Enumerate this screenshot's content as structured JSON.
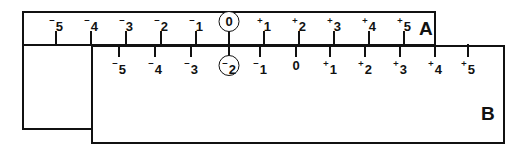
{
  "figure": {
    "ink_color": "#111111",
    "background_color": "#ffffff"
  },
  "slides": [
    {
      "id": "a",
      "letter": "A",
      "scale_name": "upper-scale",
      "origin_value": "0",
      "highlighted_reading": "0",
      "ticks": [
        {
          "value": -5,
          "sign": "⁻",
          "digit": "5",
          "x": 56,
          "circled": false
        },
        {
          "value": -4,
          "sign": "⁻",
          "digit": "4",
          "x": 91,
          "circled": false
        },
        {
          "value": -3,
          "sign": "⁻",
          "digit": "3",
          "x": 126,
          "circled": false
        },
        {
          "value": -2,
          "sign": "⁻",
          "digit": "2",
          "x": 161,
          "circled": false
        },
        {
          "value": -1,
          "sign": "⁻",
          "digit": "1",
          "x": 196,
          "circled": false
        },
        {
          "value": 0,
          "sign": "",
          "digit": "0",
          "x": 229,
          "circled": true
        },
        {
          "value": 1,
          "sign": "⁺",
          "digit": "1",
          "x": 264,
          "circled": false
        },
        {
          "value": 2,
          "sign": "⁺",
          "digit": "2",
          "x": 299,
          "circled": false
        },
        {
          "value": 3,
          "sign": "⁺",
          "digit": "3",
          "x": 334,
          "circled": false
        },
        {
          "value": 4,
          "sign": "⁺",
          "digit": "4",
          "x": 369,
          "circled": false
        },
        {
          "value": 5,
          "sign": "⁺",
          "digit": "5",
          "x": 404,
          "circled": false
        }
      ]
    },
    {
      "id": "b",
      "letter": "B",
      "scale_name": "lower-scale",
      "origin_value": "0",
      "highlighted_reading": "-2",
      "ticks": [
        {
          "value": -5,
          "sign": "⁻",
          "digit": "5",
          "x": 119,
          "circled": false
        },
        {
          "value": -4,
          "sign": "⁻",
          "digit": "4",
          "x": 155,
          "circled": false
        },
        {
          "value": -3,
          "sign": "⁻",
          "digit": "3",
          "x": 191,
          "circled": false
        },
        {
          "value": -2,
          "sign": "⁻",
          "digit": "2",
          "x": 229,
          "circled": true
        },
        {
          "value": -1,
          "sign": "⁻",
          "digit": "1",
          "x": 260,
          "circled": false
        },
        {
          "value": 0,
          "sign": "",
          "digit": "0",
          "x": 296,
          "circled": false
        },
        {
          "value": 1,
          "sign": "⁺",
          "digit": "1",
          "x": 330,
          "circled": false
        },
        {
          "value": 2,
          "sign": "⁺",
          "digit": "2",
          "x": 365,
          "circled": false
        },
        {
          "value": 3,
          "sign": "⁺",
          "digit": "3",
          "x": 400,
          "circled": false
        },
        {
          "value": 4,
          "sign": "⁺",
          "digit": "4",
          "x": 435,
          "circled": false
        },
        {
          "value": 5,
          "sign": "⁺",
          "digit": "5",
          "x": 468,
          "circled": false
        }
      ]
    }
  ]
}
